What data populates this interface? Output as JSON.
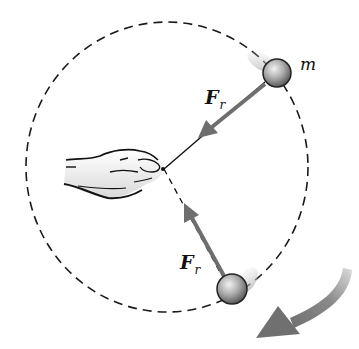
{
  "figure": {
    "type": "physics-free-body-diagram",
    "labels": {
      "mass": "m",
      "force_top": {
        "main": "F",
        "sub": "r"
      },
      "force_bottom": {
        "main": "F",
        "sub": "r"
      }
    },
    "colors": {
      "background": "#ffffff",
      "circle_path": "#1a1a1a",
      "force_arrow": "#6e6e6e",
      "motion_arrow": "#808080",
      "ball_light": "#e8e8e8",
      "ball_dark": "#6a6a6a",
      "string": "#111111"
    },
    "geometry": {
      "circle": {
        "cx": 167,
        "cy": 167,
        "rx": 141,
        "ry": 145
      },
      "hand_point": {
        "x": 164,
        "y": 169
      },
      "ball_top": {
        "cx": 277,
        "cy": 73,
        "r": 14
      },
      "ball_bottom": {
        "cx": 232,
        "cy": 289,
        "r": 15
      }
    }
  }
}
